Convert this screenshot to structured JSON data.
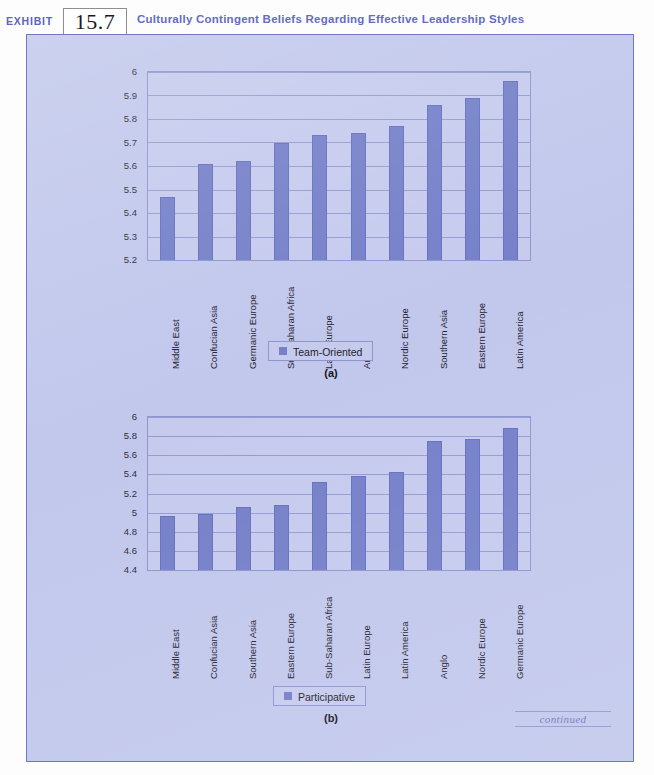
{
  "header": {
    "exhibit_word": "EXHIBIT",
    "exhibit_number": "15.7",
    "title": "Culturally Contingent Beliefs Regarding Effective Leadership Styles",
    "title_color": "#646cc4",
    "rule_color": "#5763b4"
  },
  "page": {
    "background_color": "#c2c8ec",
    "border_color": "#6e79c4",
    "footer_note": "continued"
  },
  "palette": {
    "bar_color": "#7580c9",
    "plot_background": "#c6cbee",
    "gridline_color": "#8b94cd",
    "axis_color": "#8d96d0",
    "text_color": "#23232e"
  },
  "charts": [
    {
      "id": "chart-a",
      "caption": "(a)",
      "legend_label": "Team-Oriented",
      "ytick_labels": [
        "6",
        "5.9",
        "5.8",
        "5.7",
        "5.6",
        "5.5",
        "5.4",
        "5.3",
        "5.2"
      ]
    },
    {
      "id": "chart-b",
      "caption": "(b)",
      "legend_label": "Participative",
      "ytick_labels": [
        "6",
        "5.8",
        "5.6",
        "5.4",
        "5.2",
        "5",
        "4.8",
        "4.6",
        "4.4"
      ]
    }
  ],
  "chart_data": [
    {
      "type": "bar",
      "title": "Team-Oriented",
      "panel": "(a)",
      "xlabel": "",
      "ylabel": "",
      "ylim": [
        5.2,
        6.0
      ],
      "yticks": [
        5.2,
        5.3,
        5.4,
        5.5,
        5.6,
        5.7,
        5.8,
        5.9,
        6.0
      ],
      "grid": true,
      "legend_position": "bottom-center",
      "legend": [
        "Team-Oriented"
      ],
      "categories": [
        "Middle East",
        "Confucian Asia",
        "Germanic Europe",
        "Sub-Saharan Africa",
        "Latin Europe",
        "Anglo",
        "Nordic Europe",
        "Southern Asia",
        "Eastern Europe",
        "Latin America"
      ],
      "values": [
        5.47,
        5.61,
        5.62,
        5.7,
        5.73,
        5.74,
        5.77,
        5.86,
        5.89,
        5.96
      ]
    },
    {
      "type": "bar",
      "title": "Participative",
      "panel": "(b)",
      "xlabel": "",
      "ylabel": "",
      "ylim": [
        4.4,
        6.0
      ],
      "yticks": [
        4.4,
        4.6,
        4.8,
        5.0,
        5.2,
        5.4,
        5.6,
        5.8,
        6.0
      ],
      "grid": true,
      "legend_position": "bottom-center",
      "legend": [
        "Participative"
      ],
      "categories": [
        "Middle East",
        "Confucian Asia",
        "Southern Asia",
        "Eastern Europe",
        "Sub-Saharan Africa",
        "Latin Europe",
        "Latin America",
        "Anglo",
        "Nordic Europe",
        "Germanic Europe"
      ],
      "values": [
        4.97,
        4.99,
        5.06,
        5.08,
        5.32,
        5.38,
        5.43,
        5.75,
        5.77,
        5.88
      ]
    }
  ]
}
